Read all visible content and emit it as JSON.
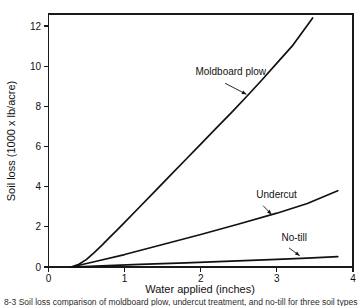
{
  "figure": {
    "background_color": "#ffffff",
    "line_color": "#111111",
    "caption": "8-3 Soil loss comparison of moldboard plow, undercut treatment, and no-till for three soil types"
  },
  "chart_data": {
    "type": "line",
    "title": "",
    "xlabel": "Water applied (inches)",
    "ylabel": "Soil loss (1000 x lb/acre)",
    "xlim": [
      0,
      4
    ],
    "ylim": [
      0,
      12.6
    ],
    "xticks": [
      "0",
      "1",
      "2",
      "3",
      "4"
    ],
    "xtick_values": [
      0,
      1,
      2,
      3,
      4
    ],
    "yticks": [
      "0",
      "2",
      "4",
      "6",
      "8",
      "10",
      "12"
    ],
    "ytick_values": [
      0,
      2,
      4,
      6,
      8,
      10,
      12
    ],
    "grid": false,
    "legend_position": "inline-annotations",
    "series": [
      {
        "name": "Moldboard plow",
        "label_x": 1.93,
        "label_y": 9.55,
        "leader_from_x": 2.32,
        "leader_from_y": 9.15,
        "leader_to_x": 2.6,
        "leader_to_y": 8.6,
        "x": [
          0.3,
          0.4,
          0.5,
          0.6,
          0.7,
          0.8,
          0.9,
          1.0,
          1.2,
          1.4,
          1.6,
          1.8,
          2.0,
          2.2,
          2.4,
          2.6,
          2.8,
          3.0,
          3.2,
          3.47
        ],
        "y": [
          0.0,
          0.14,
          0.38,
          0.72,
          1.08,
          1.46,
          1.84,
          2.22,
          3.0,
          3.78,
          4.56,
          5.34,
          6.12,
          6.9,
          7.68,
          8.48,
          9.3,
          10.15,
          11.0,
          12.4
        ]
      },
      {
        "name": "Undercut",
        "label_x": 2.73,
        "label_y": 3.42,
        "leader_from_x": 2.82,
        "leader_from_y": 3.05,
        "leader_to_x": 2.93,
        "leader_to_y": 2.62,
        "x": [
          0.3,
          0.6,
          1.0,
          1.5,
          2.0,
          2.5,
          3.0,
          3.4,
          3.8
        ],
        "y": [
          0.0,
          0.26,
          0.62,
          1.12,
          1.62,
          2.14,
          2.68,
          3.16,
          3.8
        ]
      },
      {
        "name": "No-till",
        "label_x": 3.06,
        "label_y": 1.28,
        "leader_from_x": 3.16,
        "leader_from_y": 0.95,
        "leader_to_x": 3.3,
        "leader_to_y": 0.56,
        "x": [
          0.3,
          0.7,
          1.2,
          1.8,
          2.4,
          3.0,
          3.4,
          3.8
        ],
        "y": [
          0.0,
          0.06,
          0.13,
          0.21,
          0.29,
          0.38,
          0.44,
          0.52
        ]
      }
    ]
  }
}
